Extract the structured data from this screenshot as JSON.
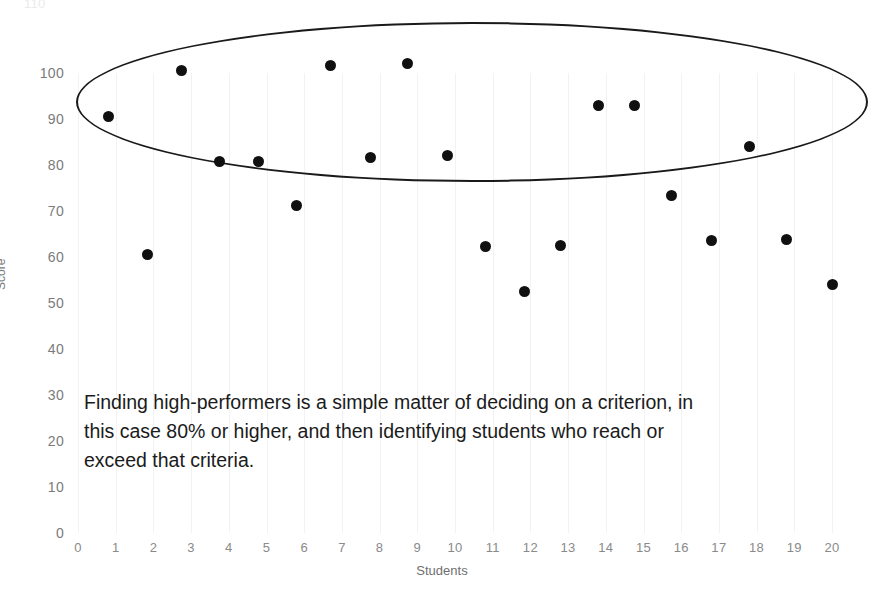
{
  "chart_data": {
    "type": "scatter",
    "title": "",
    "xlabel": "Students",
    "ylabel": "Score",
    "xlim": [
      0,
      20
    ],
    "ylim": [
      0,
      110
    ],
    "grid": "vertical",
    "legend": "none",
    "x_ticks": [
      "0",
      "1",
      "2",
      "3",
      "4",
      "5",
      "6",
      "7",
      "8",
      "9",
      "10",
      "11",
      "12",
      "13",
      "14",
      "15",
      "16",
      "17",
      "18",
      "19",
      "20"
    ],
    "y_ticks": [
      "0",
      "10",
      "20",
      "30",
      "40",
      "50",
      "60",
      "70",
      "80",
      "90",
      "100"
    ],
    "clipped_top_tick": "110",
    "series": [
      {
        "name": "Scores",
        "points": [
          {
            "student": 1,
            "x": 0.8,
            "y": 90.5,
            "highlighted": true
          },
          {
            "student": 2,
            "x": 1.85,
            "y": 60.5,
            "highlighted": false
          },
          {
            "student": 3,
            "x": 2.75,
            "y": 100.6,
            "highlighted": true
          },
          {
            "student": 4,
            "x": 3.75,
            "y": 80.7,
            "highlighted": true
          },
          {
            "student": 5,
            "x": 4.8,
            "y": 80.8,
            "highlighted": true
          },
          {
            "student": 6,
            "x": 5.8,
            "y": 71.3,
            "highlighted": false
          },
          {
            "student": 7,
            "x": 6.7,
            "y": 101.6,
            "highlighted": true
          },
          {
            "student": 8,
            "x": 7.75,
            "y": 81.6,
            "highlighted": true
          },
          {
            "student": 9,
            "x": 8.75,
            "y": 102.0,
            "highlighted": true
          },
          {
            "student": 10,
            "x": 9.8,
            "y": 82.0,
            "highlighted": true
          },
          {
            "student": 11,
            "x": 10.8,
            "y": 62.3,
            "highlighted": false
          },
          {
            "student": 12,
            "x": 11.85,
            "y": 52.5,
            "highlighted": false
          },
          {
            "student": 13,
            "x": 12.8,
            "y": 62.6,
            "highlighted": false
          },
          {
            "student": 14,
            "x": 13.8,
            "y": 93.0,
            "highlighted": true
          },
          {
            "student": 15,
            "x": 14.75,
            "y": 93.0,
            "highlighted": true
          },
          {
            "student": 16,
            "x": 15.75,
            "y": 73.4,
            "highlighted": false
          },
          {
            "student": 17,
            "x": 16.8,
            "y": 63.5,
            "highlighted": false
          },
          {
            "student": 18,
            "x": 17.8,
            "y": 84.0,
            "highlighted": true
          },
          {
            "student": 19,
            "x": 18.8,
            "y": 63.9,
            "highlighted": false
          },
          {
            "student": 20,
            "x": 20.0,
            "y": 54.1,
            "highlighted": false
          }
        ]
      }
    ],
    "annotation": {
      "lines": [
        "Finding high-performers is a simple matter of deciding on a criterion, in",
        "this case 80% or higher, and then identifying students who reach or",
        "exceed that criteria."
      ],
      "criterion": "80%"
    },
    "highlight_region": {
      "shape": "ellipse",
      "label": "high-performers-ellipse",
      "color": "#1a1a1a"
    }
  },
  "colors": {
    "point": "#101010",
    "ellipse": "#1a1a1a",
    "gridline": "#f2f2f2",
    "tick_text": "#7b7b7b",
    "background": "#ffffff"
  }
}
